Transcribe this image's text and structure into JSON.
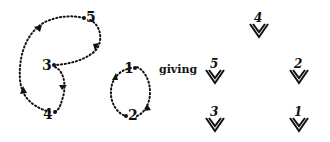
{
  "left_graph": {
    "nodes": [
      {
        "id": "5",
        "label": "5"
      },
      {
        "id": "3",
        "label": "3"
      },
      {
        "id": "4",
        "label": "4"
      },
      {
        "id": "1",
        "label": "1"
      },
      {
        "id": "2",
        "label": "2"
      }
    ],
    "edges": [
      {
        "from": "5",
        "to": "3"
      },
      {
        "from": "3",
        "to": "4"
      },
      {
        "from": "4",
        "to": "5"
      },
      {
        "from": "1",
        "to": "2"
      },
      {
        "from": "2",
        "to": "1"
      }
    ],
    "style": "dotted"
  },
  "connector_text": "giving",
  "right_symbols": [
    {
      "label": "4"
    },
    {
      "label": "5"
    },
    {
      "label": "2"
    },
    {
      "label": "3"
    },
    {
      "label": "1"
    }
  ],
  "colors": {
    "ink": "#111111",
    "background": "#ffffff"
  }
}
